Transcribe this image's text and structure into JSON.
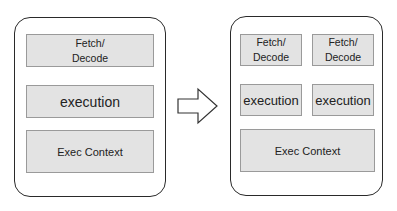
{
  "left_core": {
    "fetch_decode": "Fetch/\nDecode",
    "execution": "execution",
    "exec_context": "Exec Context"
  },
  "arrow": {
    "icon": "right-arrow-icon"
  },
  "right_core": {
    "fetch_decode_1": "Fetch/\nDecode",
    "fetch_decode_2": "Fetch/\nDecode",
    "execution_1": "execution",
    "execution_2": "execution",
    "exec_context": "Exec Context"
  }
}
